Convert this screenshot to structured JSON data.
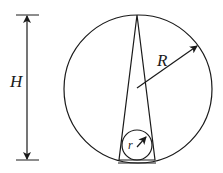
{
  "diagram": {
    "labels": {
      "height": "H",
      "big_radius": "R",
      "small_radius": "r"
    },
    "colors": {
      "stroke": "#1a1a1a",
      "background": "#ffffff"
    }
  }
}
